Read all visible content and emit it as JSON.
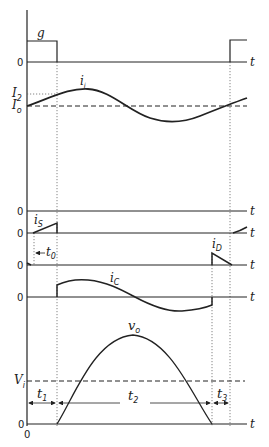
{
  "diagram": {
    "type": "waveform-timing-diagram",
    "time_axis_label": "t",
    "zero_label": "0",
    "origin_label": "0",
    "waveforms": [
      {
        "id": "gate",
        "label": "g"
      },
      {
        "id": "input_current",
        "label": "i",
        "subscript": "i",
        "levels": [
          {
            "label": "I",
            "sub": "2"
          },
          {
            "label": "I",
            "sub": "o"
          }
        ]
      },
      {
        "id": "blank",
        "label": ""
      },
      {
        "id": "switch_current",
        "label": "i",
        "subscript": "S"
      },
      {
        "id": "diode_current",
        "label": "i",
        "subscript": "D"
      },
      {
        "id": "capacitor_current",
        "label": "i",
        "subscript": "C"
      },
      {
        "id": "output_voltage",
        "label": "v",
        "subscript": "o",
        "levels": [
          {
            "label": "V",
            "sub": "i"
          }
        ]
      }
    ],
    "intervals": [
      {
        "label": "t",
        "sub": "0"
      },
      {
        "label": "t",
        "sub": "1"
      },
      {
        "label": "t",
        "sub": "2"
      },
      {
        "label": "t",
        "sub": "3"
      }
    ],
    "colors": {
      "line": "#222222",
      "dotted": "#666666"
    }
  }
}
